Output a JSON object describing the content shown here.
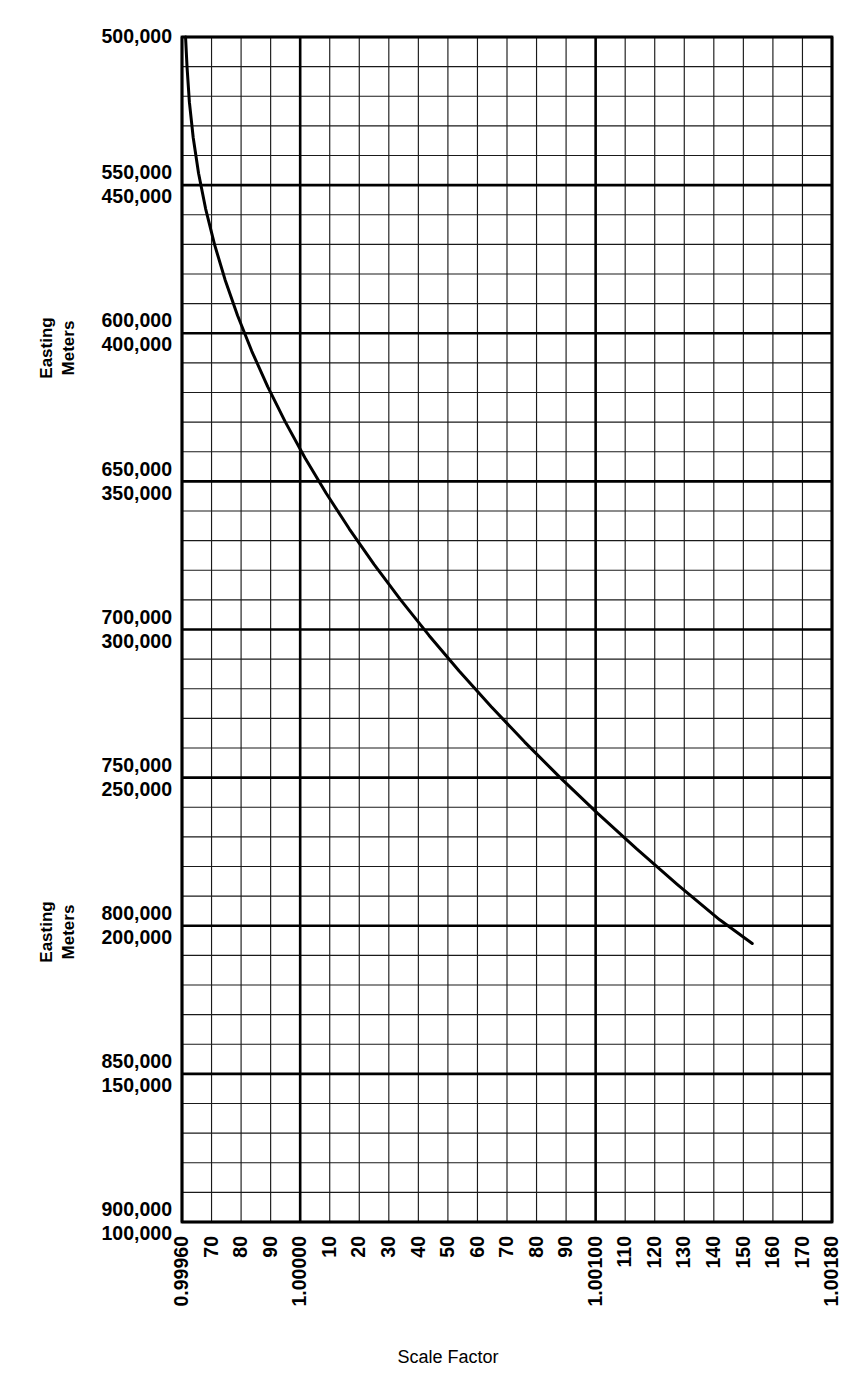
{
  "figure": {
    "background_color": "#ffffff",
    "ink_color": "#000000"
  },
  "axes": {
    "x": {
      "title": "Scale Factor",
      "min": 0.9996,
      "max": 1.0018,
      "tick_labels": [
        "0.99960",
        "70",
        "80",
        "90",
        "1.00000",
        "10",
        "20",
        "30",
        "40",
        "50",
        "60",
        "70",
        "80",
        "90",
        "1.00100",
        "110",
        "120",
        "130",
        "140",
        "150",
        "160",
        "170",
        "1.00180"
      ],
      "tick_values": [
        0.9996,
        0.9997,
        0.9998,
        0.9999,
        1.0,
        1.0001,
        1.0002,
        1.0003,
        1.0004,
        1.0005,
        1.0006,
        1.0007,
        1.0008,
        1.0009,
        1.001,
        1.0011,
        1.0012,
        1.0013,
        1.0014,
        1.0015,
        1.0016,
        1.0017,
        1.0018
      ],
      "major_tick_labels": [
        "0.99960",
        "1.00000",
        "1.00100",
        "1.00180"
      ],
      "label_rotation_deg": -90,
      "minor_divisions_per_cell": 1
    },
    "y": {
      "side_label_top": "Easting\nMeters",
      "side_label_line1": "Easting",
      "side_label_line2": "Meters",
      "label_rotation_deg": -90,
      "upper_series_name": "Easting Meters (east of CM)",
      "lower_series_name": "Easting Meters (west of CM)",
      "tick_pairs": [
        {
          "upper": "500,000",
          "lower": "500,000",
          "single": true,
          "y_value": 500000
        },
        {
          "upper": "550,000",
          "lower": "450,000",
          "single": false,
          "y_value": 450000
        },
        {
          "upper": "600,000",
          "lower": "400,000",
          "single": false,
          "y_value": 400000
        },
        {
          "upper": "650,000",
          "lower": "350,000",
          "single": false,
          "y_value": 350000
        },
        {
          "upper": "700,000",
          "lower": "300,000",
          "single": false,
          "y_value": 300000
        },
        {
          "upper": "750,000",
          "lower": "250,000",
          "single": false,
          "y_value": 250000
        },
        {
          "upper": "800,000",
          "lower": "200,000",
          "single": false,
          "y_value": 200000
        },
        {
          "upper": "850,000",
          "lower": "150,000",
          "single": false,
          "y_value": 150000
        },
        {
          "upper": "900,000",
          "lower": "100,000",
          "single": false,
          "y_value": 100000
        }
      ],
      "min": 100000,
      "max": 500000,
      "minor_divisions_per_major": 5
    }
  },
  "chart_data": {
    "type": "line",
    "title": "",
    "xlabel": "Scale Factor",
    "ylabel": "Easting Meters",
    "xlim": [
      0.9996,
      1.0018
    ],
    "ylim": [
      100000,
      500000
    ],
    "grid": true,
    "legend": "none",
    "series": [
      {
        "name": "UTM scale factor vs easting",
        "x": [
          0.999612,
          0.999617,
          0.999625,
          0.999638,
          0.999656,
          0.99968,
          0.99971,
          0.999746,
          0.999788,
          0.999836,
          0.99989,
          0.99995,
          1.000016,
          1.000088,
          1.000166,
          1.00025,
          1.00034,
          1.000436,
          1.000538,
          1.000646,
          1.00076,
          1.00088,
          1.001006,
          1.001138,
          1.001276,
          1.00142,
          1.00153
        ],
        "y": [
          500000,
          490000,
          478000,
          466000,
          454000,
          442000,
          430000,
          418000,
          406000,
          394000,
          382000,
          370000,
          358000,
          346000,
          334000,
          322000,
          310000,
          298000,
          286000,
          274000,
          262000,
          250000,
          238000,
          226000,
          214000,
          202000,
          194000
        ],
        "note": "Curve descends steeply near the left axis then straightens toward the lower right, leaving the frame at the bottom edge near scale factor 1.00153"
      }
    ]
  }
}
